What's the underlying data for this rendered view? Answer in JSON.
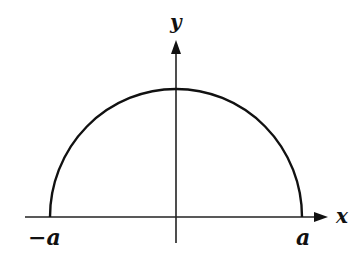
{
  "diagram": {
    "type": "semicircle",
    "axes": {
      "x_label": "x",
      "y_label": "y"
    },
    "endpoints": {
      "left_label": "−a",
      "right_label": "a"
    },
    "colors": {
      "stroke": "#111111",
      "background": "#ffffff"
    }
  }
}
